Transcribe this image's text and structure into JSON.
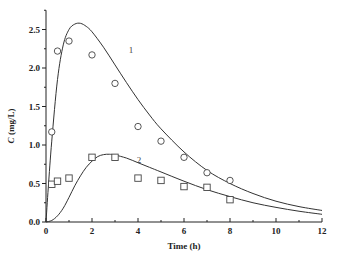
{
  "chart_data": {
    "type": "scatter",
    "title": "",
    "xlabel": "Time (h)",
    "ylabel": "C (mg/L)",
    "ylabel_italic_part": "C",
    "ylabel_unit_part": " (mg/L)",
    "xlim": [
      0,
      12
    ],
    "ylim": [
      0,
      2.75
    ],
    "xticks": [
      0,
      2,
      4,
      6,
      8,
      10,
      12
    ],
    "xtick_labels": [
      "0",
      "2",
      "4",
      "6",
      "8",
      "10",
      "12"
    ],
    "yticks": [
      0.0,
      0.5,
      1.0,
      1.5,
      2.0,
      2.5
    ],
    "ytick_labels": [
      "0.0",
      "0.5",
      "1.0",
      "1.5",
      "2.0",
      "2.5"
    ],
    "grid": false,
    "legend": "none; curves labeled inline as 1 and 2",
    "series": [
      {
        "name": "1",
        "marker": "circle",
        "x": [
          0.25,
          0.5,
          1,
          2,
          3,
          4,
          5,
          6,
          7,
          8
        ],
        "y": [
          1.17,
          2.22,
          2.35,
          2.17,
          1.8,
          1.24,
          1.05,
          0.84,
          0.64,
          0.54
        ],
        "fit_curve": {
          "x": [
            0,
            0.1,
            0.25,
            0.5,
            0.75,
            1.0,
            1.25,
            1.5,
            1.75,
            2.0,
            2.5,
            3.0,
            3.5,
            4.0,
            4.5,
            5.0,
            6.0,
            7.0,
            8.0,
            9.0,
            10.0,
            11.0,
            12.0
          ],
          "y": [
            0.0,
            0.45,
            1.05,
            1.85,
            2.3,
            2.5,
            2.57,
            2.58,
            2.54,
            2.47,
            2.27,
            2.04,
            1.81,
            1.59,
            1.39,
            1.21,
            0.91,
            0.67,
            0.5,
            0.37,
            0.27,
            0.2,
            0.15
          ]
        },
        "label": "1",
        "label_pos": [
          3.6,
          2.2
        ]
      },
      {
        "name": "2",
        "marker": "square",
        "x": [
          0.25,
          0.5,
          1,
          2,
          3,
          4,
          5,
          6,
          7,
          8
        ],
        "y": [
          0.49,
          0.53,
          0.57,
          0.84,
          0.84,
          0.57,
          0.54,
          0.46,
          0.45,
          0.29
        ],
        "fit_curve": {
          "x": [
            0,
            0.25,
            0.5,
            0.75,
            1.0,
            1.25,
            1.5,
            1.75,
            2.0,
            2.25,
            2.5,
            2.75,
            3.0,
            3.5,
            4.0,
            4.5,
            5.0,
            6.0,
            7.0,
            8.0,
            9.0,
            10.0,
            11.0,
            12.0
          ],
          "y": [
            0.0,
            0.02,
            0.08,
            0.18,
            0.32,
            0.47,
            0.6,
            0.71,
            0.79,
            0.85,
            0.875,
            0.88,
            0.87,
            0.83,
            0.77,
            0.71,
            0.65,
            0.53,
            0.42,
            0.33,
            0.25,
            0.19,
            0.14,
            0.1
          ]
        },
        "label": "2",
        "label_pos": [
          3.95,
          0.76
        ]
      }
    ]
  },
  "axes": {
    "x_title": "Time (h)",
    "y_title_italic": "C",
    "y_title_rest": " (mg/L)"
  }
}
